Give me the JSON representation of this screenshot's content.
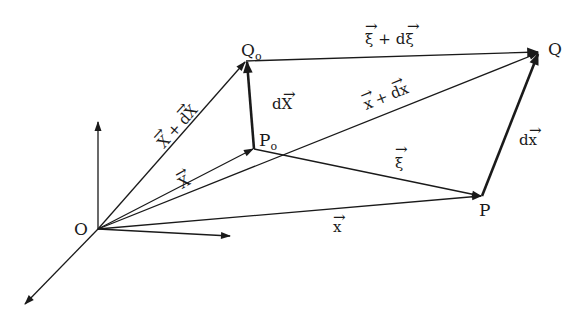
{
  "figure": {
    "stroke_color": "#1a1a1a",
    "background": "#ffffff"
  },
  "points": {
    "O": {
      "label": "O",
      "sub": "",
      "x": 98,
      "y": 229
    },
    "P0": {
      "label": "P",
      "sub": "o",
      "x": 254,
      "y": 149
    },
    "Q0": {
      "label": "Q",
      "sub": "o",
      "x": 246,
      "y": 61
    },
    "P": {
      "label": "P",
      "sub": "",
      "x": 482,
      "y": 196
    },
    "Q": {
      "label": "Q",
      "sub": "",
      "x": 539,
      "y": 52
    }
  },
  "axes": [
    {
      "name": "vertical-axis",
      "from": [
        98,
        229
      ],
      "to": [
        98,
        120
      ]
    },
    {
      "name": "horizontal-axis",
      "from": [
        98,
        229
      ],
      "to": [
        232,
        236
      ]
    },
    {
      "name": "depth-axis",
      "from": [
        98,
        229
      ],
      "to": [
        24,
        305
      ]
    }
  ],
  "vectors": [
    {
      "name": "X",
      "from": "O",
      "to": "P0",
      "label": "X",
      "label_suffix": "",
      "bold": false
    },
    {
      "name": "X-plus-dX",
      "from": "O",
      "to": "Q0",
      "label": "X + dX",
      "bold": false
    },
    {
      "name": "dX",
      "from": "P0",
      "to": "Q0",
      "label": "dX",
      "bold": true
    },
    {
      "name": "x",
      "from": "O",
      "to": "P",
      "label": "x",
      "bold": false
    },
    {
      "name": "x-plus-dx",
      "from": "O",
      "to": "Q",
      "label": "x + dx",
      "bold": false
    },
    {
      "name": "xi",
      "from": "P0",
      "to": "P",
      "label": "ξ",
      "bold": false
    },
    {
      "name": "xi-plus-dxi",
      "from": "Q0",
      "to": "Q",
      "label": "ξ + dξ",
      "bold": false
    },
    {
      "name": "dx",
      "from": "P",
      "to": "Q",
      "label": "dx",
      "bold": true
    }
  ],
  "labels": {
    "O": "O",
    "P0_main": "P",
    "P0_sub": "o",
    "Q0_main": "Q",
    "Q0_sub": "o",
    "P": "P",
    "Q": "Q",
    "X": "X",
    "X_plus": "X",
    "plus1": "+",
    "dX_d": "d",
    "dX_X": "X",
    "dX2_d": "d",
    "dX2_X": "X",
    "x": "x",
    "xplus_x": "x",
    "plus2": "+",
    "xplus_d": "d",
    "xplus_dx": "x",
    "xi": "ξ",
    "xi2": "ξ",
    "plus3": "+",
    "xi2_d": "d",
    "xi2_xi": "ξ",
    "dx_d": "d",
    "dx_x": "x",
    "arrow_glyph": "⃗"
  }
}
